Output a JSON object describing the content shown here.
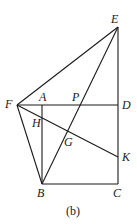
{
  "diagram": {
    "caption": "(b)",
    "points": {
      "E": {
        "label": "E",
        "x": 118,
        "y": 27
      },
      "F": {
        "label": "F",
        "x": 17,
        "y": 105
      },
      "A": {
        "label": "A",
        "x": 42,
        "y": 105
      },
      "P": {
        "label": "P",
        "x": 80,
        "y": 105
      },
      "D": {
        "label": "D",
        "x": 118,
        "y": 105
      },
      "H": {
        "label": "H",
        "x": 42,
        "y": 119
      },
      "G": {
        "label": "G",
        "x": 68,
        "y": 131
      },
      "K": {
        "label": "K",
        "x": 118,
        "y": 157
      },
      "B": {
        "label": "B",
        "x": 42,
        "y": 184
      },
      "C": {
        "label": "C",
        "x": 118,
        "y": 184
      }
    },
    "segments": [
      [
        "F",
        "E"
      ],
      [
        "E",
        "D"
      ],
      [
        "D",
        "C"
      ],
      [
        "C",
        "B"
      ],
      [
        "B",
        "A"
      ],
      [
        "F",
        "D"
      ],
      [
        "F",
        "B"
      ],
      [
        "F",
        "K"
      ],
      [
        "B",
        "E"
      ]
    ]
  }
}
